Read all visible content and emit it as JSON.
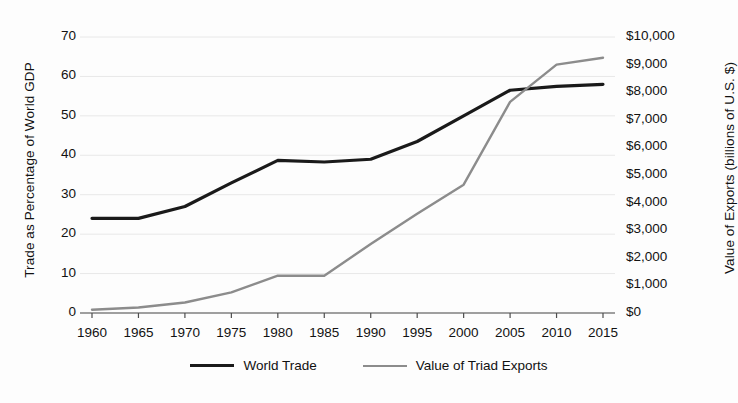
{
  "chart_data": {
    "type": "line",
    "title": "",
    "xlabel": "",
    "ylabel": "Trade as Percentage of World GDP",
    "y2label": "Value of Exports (billions of U.S. $)",
    "grid": true,
    "legend_position": "bottom",
    "categories": [
      1960,
      1965,
      1970,
      1975,
      1980,
      1985,
      1990,
      1995,
      2000,
      2005,
      2010,
      2015
    ],
    "x_tick_labels": [
      "1960",
      "1965",
      "1970",
      "1975",
      "1980",
      "1985",
      "1990",
      "1995",
      "2000",
      "2005",
      "2010",
      "2015"
    ],
    "ylim": [
      0,
      70
    ],
    "y_ticks": [
      0,
      10,
      20,
      30,
      40,
      50,
      60,
      70
    ],
    "y_tick_labels": [
      "0",
      "10",
      "20",
      "30",
      "40",
      "50",
      "60",
      "70"
    ],
    "y2lim": [
      0,
      10000
    ],
    "y2_ticks": [
      0,
      1000,
      2000,
      3000,
      4000,
      5000,
      6000,
      7000,
      8000,
      9000,
      10000
    ],
    "y2_tick_labels": [
      "$0",
      "$1,000",
      "$2,000",
      "$3,000",
      "$4,000",
      "$5,000",
      "$6,000",
      "$7,000",
      "$8,000",
      "$9,000",
      "$10,000"
    ],
    "series": [
      {
        "name": "World Trade",
        "axis": "left",
        "color": "#1a1a1a",
        "width": 3.2,
        "values": [
          24,
          24,
          27,
          33,
          38.7,
          38.3,
          39,
          43.5,
          50,
          56.5,
          57.5,
          58
        ]
      },
      {
        "name": "Value of Triad Exports",
        "axis": "right",
        "color": "#8c8c8c",
        "width": 2.4,
        "values": [
          120,
          200,
          380,
          750,
          1350,
          1350,
          2500,
          3600,
          4650,
          7650,
          9000,
          9250
        ]
      }
    ]
  },
  "legend": {
    "entries": [
      {
        "label": "World Trade",
        "color": "#1a1a1a",
        "width": 3.6
      },
      {
        "label": "Value of Triad Exports",
        "color": "#8c8c8c",
        "width": 2.6
      }
    ]
  },
  "colors": {
    "background": "#fdfdfd",
    "axis": "#4d4d4d",
    "grid": "#e8e8e8",
    "world_trade": "#1a1a1a",
    "triad_exports": "#8c8c8c"
  }
}
